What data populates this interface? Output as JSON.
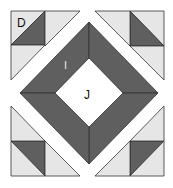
{
  "diagram": {
    "type": "quilt-block",
    "colors": {
      "dark": "#5f5f5f",
      "light": "#e6e6e6",
      "white": "#ffffff",
      "stroke": "#222222"
    },
    "labels": {
      "corner_patch": "D",
      "frame": "I",
      "center": "J"
    }
  }
}
